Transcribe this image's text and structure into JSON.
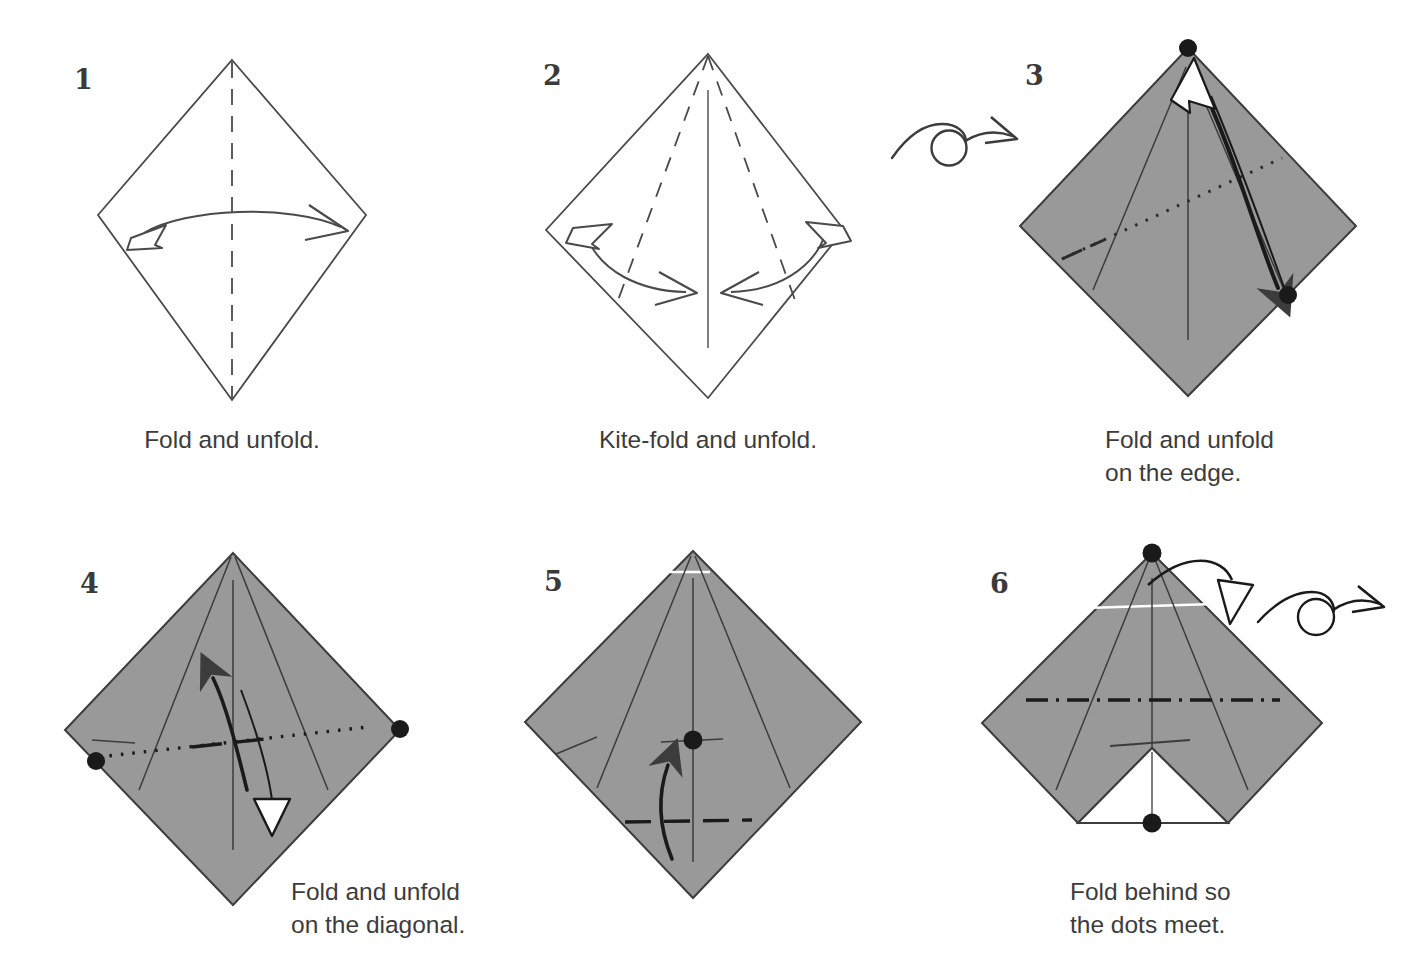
{
  "page": {
    "background_color": "#ffffff",
    "paper_front_color": "#ffffff",
    "paper_back_color": "#999999",
    "line_color": "#3c3c3c",
    "text_color": "#3c3c3c"
  },
  "steps": [
    {
      "number": "1",
      "caption": "Fold and unfold.",
      "caption_align": "center",
      "shape": "diamond",
      "fill": "white",
      "creases": [
        "vertical center valley fold (dashed)"
      ],
      "arrows": [
        "double-headed curved arrow, hollow head left, solid head right"
      ],
      "dots": []
    },
    {
      "number": "2",
      "caption": "Kite-fold and unfold.",
      "caption_align": "center",
      "shape": "diamond",
      "fill": "white",
      "creases": [
        "vertical center crease (solid)",
        "left kite valley fold (dashed)",
        "right kite valley fold (dashed)"
      ],
      "arrows": [
        "left double-headed curved arrow",
        "right double-headed curved arrow"
      ],
      "dots": []
    },
    {
      "number": "3",
      "caption": "Fold and unfold\non the edge.",
      "caption_align": "left",
      "shape": "diamond",
      "fill": "gray",
      "creases": [
        "dotted fold reference line rising to the right",
        "kite creases",
        "vertical center crease"
      ],
      "arrows": [
        "solid fold arrow from top dot down to right dot",
        "hollow unfold arrow returning up"
      ],
      "dots": [
        "top vertex",
        "right edge"
      ]
    },
    {
      "number": "4",
      "caption": "Fold and unfold\non the diagonal.",
      "caption_align": "left",
      "shape": "diamond",
      "fill": "gray",
      "creases": [
        "horizontal dot-dash fold line between left and right dots",
        "kite creases",
        "vertical center crease"
      ],
      "arrows": [
        "solid fold arrow pointing up",
        "hollow unfold arrow pointing down"
      ],
      "dots": [
        "left vertex",
        "right vertex"
      ]
    },
    {
      "number": "5",
      "caption": "",
      "caption_align": "center",
      "shape": "diamond",
      "fill": "gray",
      "creases": [
        "horizontal valley fold (dashed) near bottom",
        "kite creases",
        "vertical center crease",
        "short horizontal crease at center dot"
      ],
      "arrows": [
        "solid curved arrow pointing up"
      ],
      "dots": [
        "center"
      ]
    },
    {
      "number": "6",
      "caption": "Fold behind so\nthe dots meet.",
      "caption_align": "left",
      "shape": "flat-bottom kite with white triangular notch",
      "fill": "gray",
      "creases": [
        "horizontal dash-dot mountain fold line",
        "kite creases",
        "vertical center crease",
        "short horizontal crease above the notch"
      ],
      "arrows": [
        "hollow fold-behind arrow over the top edge"
      ],
      "dots": [
        "top vertex",
        "bottom center of notch"
      ]
    }
  ],
  "symbols": [
    {
      "name": "turn-over-symbol",
      "label": "turn the model over",
      "between_steps": "2 and 3"
    },
    {
      "name": "turn-over-symbol",
      "label": "turn the model over",
      "after_step": "6"
    }
  ]
}
